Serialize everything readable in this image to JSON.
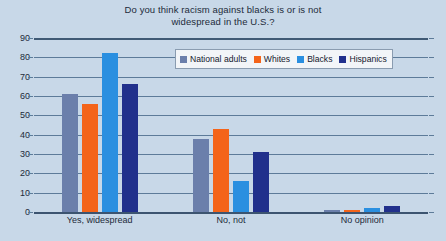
{
  "chart_data": {
    "type": "bar",
    "title": "Do you think racism against blacks is or is not widespread in the U.S.?",
    "title_lines": [
      "Do you think racism against blacks is or is not",
      "widespread in the U.S.?"
    ],
    "categories": [
      "Yes, widespread",
      "No, not",
      "No opinion"
    ],
    "series": [
      {
        "name": "National adults",
        "color": "#6b7fab",
        "values": [
          61,
          38,
          1
        ]
      },
      {
        "name": "Whites",
        "color": "#f4641a",
        "values": [
          56,
          43,
          1
        ]
      },
      {
        "name": "Blacks",
        "color": "#2a8fe0",
        "values": [
          82,
          16,
          2
        ]
      },
      {
        "name": "Hispanics",
        "color": "#21308c",
        "values": [
          66,
          31,
          3
        ]
      }
    ],
    "xlabel": "",
    "ylabel": "",
    "ylim": [
      0,
      90
    ],
    "yticks": [
      0,
      10,
      20,
      30,
      40,
      50,
      60,
      70,
      80,
      90
    ],
    "ytick_labels": [
      "0",
      "10",
      "20",
      "30",
      "40",
      "50",
      "60",
      "70",
      "80",
      "90"
    ],
    "grid": true,
    "legend_position": "top-right-inside",
    "background_color": "#c8d8e8",
    "gridline_color": "#5d7b99"
  }
}
